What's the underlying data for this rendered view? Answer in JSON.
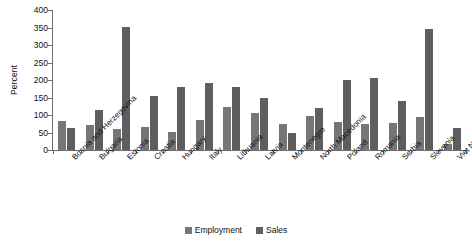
{
  "chart_data": {
    "type": "bar",
    "title": "",
    "subtitle": "",
    "xlabel": "",
    "ylabel": "Percent",
    "ylim": [
      0,
      400
    ],
    "ytick_interval": 50,
    "yticks": [
      400,
      350,
      300,
      250,
      200,
      150,
      100,
      50,
      0
    ],
    "grid": false,
    "legend_position": "bottom-center",
    "orientation": "vertical",
    "grouping": "grouped",
    "categories": [
      "Bosnia and Herzegovina",
      "Bulgaria",
      "Estonia",
      "Croatia",
      "Hungary",
      "Italy",
      "Lithuania",
      "Latvia",
      "Montenegro",
      "North Macedonia",
      "Poland",
      "Romania",
      "Serbia",
      "Slovenia",
      "Viet Nam"
    ],
    "series": [
      {
        "name": "Employment",
        "color": "#767676",
        "values": [
          82,
          72,
          59,
          66,
          51,
          85,
          124,
          107,
          73,
          98,
          80,
          73,
          77,
          95,
          17
        ]
      },
      {
        "name": "Sales",
        "color": "#5e5e5e",
        "values": [
          64,
          113,
          351,
          155,
          179,
          192,
          180,
          150,
          48,
          120,
          200,
          207,
          140,
          346,
          62
        ]
      }
    ]
  },
  "legend": {
    "items": [
      {
        "label": "Employment",
        "color": "#767676"
      },
      {
        "label": "Sales",
        "color": "#5e5e5e"
      }
    ]
  },
  "axes": {
    "y_title": "Percent",
    "y_tick_labels": [
      "400",
      "350",
      "300",
      "250",
      "200",
      "150",
      "100",
      "50",
      "0"
    ]
  }
}
